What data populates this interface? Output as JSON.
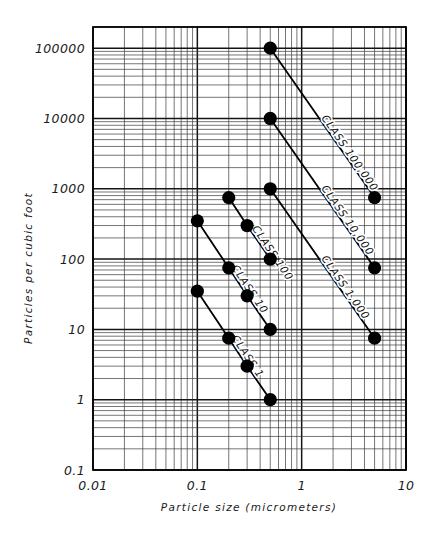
{
  "figure": {
    "name": "cleanroom-particle-class-chart",
    "background": "#ffffff",
    "ink": "#000000"
  },
  "chart_data": {
    "type": "line",
    "title": "",
    "xlabel": "Particle size (micrometers)",
    "ylabel": "Particles per cubic foot",
    "xscale": "log",
    "yscale": "log",
    "xlim": [
      0.01,
      10
    ],
    "ylim": [
      0.1,
      200000
    ],
    "grid": true,
    "legend": "inline-along-lines",
    "xticks": [
      "0.01",
      "0.1",
      "1",
      "10"
    ],
    "xtick_values": [
      0.01,
      0.1,
      1,
      10
    ],
    "yticks": [
      "0.1",
      "1",
      "10",
      "100",
      "1000",
      "10000",
      "100000"
    ],
    "ytick_values": [
      0.1,
      1,
      10,
      100,
      1000,
      10000,
      100000
    ],
    "series": [
      {
        "name": "CLASS 100,000",
        "label": "CLASS 100,000",
        "x": [
          0.5,
          5
        ],
        "y": [
          100000,
          750
        ],
        "label_angle": 57
      },
      {
        "name": "CLASS 10,000",
        "label": "CLASS 10,000",
        "x": [
          0.5,
          5
        ],
        "y": [
          10000,
          75
        ],
        "label_angle": 57
      },
      {
        "name": "CLASS 1,000",
        "label": "CLASS 1,000",
        "x": [
          0.5,
          5
        ],
        "y": [
          1000,
          7.5
        ],
        "label_angle": 57
      },
      {
        "name": "CLASS 100",
        "label": "CLASS 100",
        "x": [
          0.2,
          0.3,
          0.5
        ],
        "y": [
          750,
          300,
          100
        ],
        "label_angle": 57
      },
      {
        "name": "CLASS 10",
        "label": "CLASS 10",
        "x": [
          0.1,
          0.2,
          0.3,
          0.5
        ],
        "y": [
          350,
          75,
          30,
          10
        ],
        "label_angle": 57
      },
      {
        "name": "CLASS 1",
        "label": "CLASS 1",
        "x": [
          0.1,
          0.2,
          0.3,
          0.5
        ],
        "y": [
          35,
          7.5,
          3,
          1
        ],
        "label_angle": 57
      }
    ]
  },
  "axes": {
    "x_title": "Particle size (micrometers)",
    "y_title": "Particles per cubic foot",
    "x_tick_labels": [
      "0.01",
      "0.1",
      "1",
      "10"
    ],
    "y_tick_labels": [
      "100000",
      "10000",
      "1000",
      "100",
      "10",
      "1",
      "0.1"
    ]
  }
}
